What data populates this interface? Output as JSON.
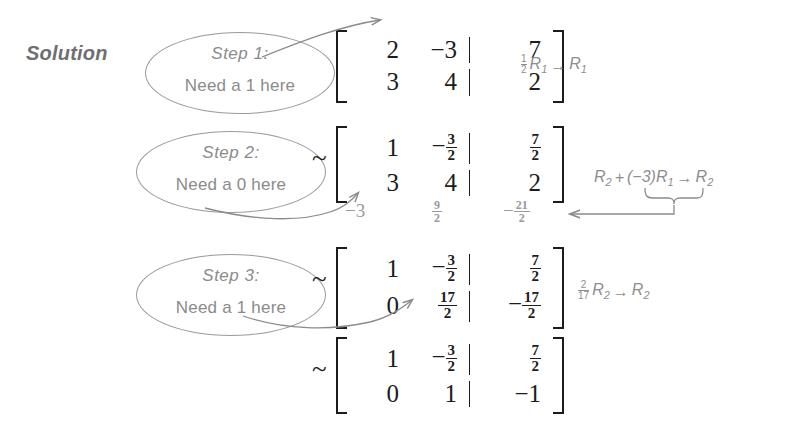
{
  "page": {
    "title": "Solution",
    "width": 803,
    "height": 428,
    "ink_color": "#1c1c1c",
    "annotation_color": "#8b8b8b",
    "background": "#ffffff"
  },
  "callouts": [
    {
      "step": "Step 1:",
      "need": "Need a 1 here"
    },
    {
      "step": "Step 2:",
      "need": "Need a 0 here"
    },
    {
      "step": "Step 3:",
      "need": "Need a 1 here"
    }
  ],
  "tilde": "~",
  "matrices": [
    {
      "id": "matrix-1",
      "rows": [
        {
          "c1": "2",
          "c2": "−3",
          "c3": "7"
        },
        {
          "c1": "3",
          "c2": "4",
          "c3": "2"
        }
      ]
    },
    {
      "id": "matrix-2",
      "rows": [
        {
          "c1": "1",
          "c2_sign": "−",
          "c2_num": "3",
          "c2_den": "2",
          "c3_num": "7",
          "c3_den": "2"
        },
        {
          "c1": "3",
          "c2": "4",
          "c3": "2"
        }
      ]
    },
    {
      "id": "matrix-3",
      "rows": [
        {
          "c1": "1",
          "c2_sign": "−",
          "c2_num": "3",
          "c2_den": "2",
          "c3_num": "7",
          "c3_den": "2"
        },
        {
          "c1": "0",
          "c2_num": "17",
          "c2_den": "2",
          "c3_sign": "−",
          "c3_num": "17",
          "c3_den": "2"
        }
      ]
    },
    {
      "id": "matrix-4",
      "rows": [
        {
          "c1": "1",
          "c2_sign": "−",
          "c2_num": "3",
          "c2_den": "2",
          "c3_num": "7",
          "c3_den": "2"
        },
        {
          "c1": "0",
          "c2": "1",
          "c3": "−1"
        }
      ]
    }
  ],
  "working_row": {
    "col1": "−3",
    "col2_num": "9",
    "col2_den": "2",
    "col3_sign": "−",
    "col3_num": "21",
    "col3_den": "2"
  },
  "operations": [
    {
      "id": "op-1",
      "scalar_num": "1",
      "scalar_den": "2",
      "target": "R",
      "target_sub": "1",
      "arrow": "→",
      "result": "R",
      "result_sub": "1",
      "full_text": "½R₁ → R₁"
    },
    {
      "id": "op-2",
      "lead": "R",
      "lead_sub": "2",
      "plus": "+",
      "factor": "(−3)R",
      "factor_sub": "1",
      "arrow": "→",
      "result": "R",
      "result_sub": "2",
      "full_text": "R₂ + (−3)R₁ → R₂"
    },
    {
      "id": "op-3",
      "scalar_num": "2",
      "scalar_den": "17",
      "target": "R",
      "target_sub": "2",
      "arrow": "→",
      "result": "R",
      "result_sub": "2",
      "full_text": "2/17 R₂ → R₂"
    }
  ]
}
